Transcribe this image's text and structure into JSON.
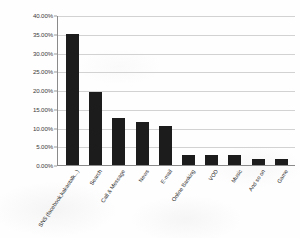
{
  "chart_data": {
    "type": "bar",
    "title": "",
    "xlabel": "",
    "ylabel": "",
    "categories": [
      "SNS (facebook,kakaotalk...)",
      "Search",
      "Call & Message",
      "News",
      "E-mail",
      "Online Banking",
      "VOD",
      "Music",
      "And so on",
      "Game"
    ],
    "values": [
      35.0,
      19.5,
      12.5,
      11.5,
      10.5,
      2.8,
      2.8,
      2.8,
      1.6,
      1.6
    ],
    "value_labels": [
      "35.00%",
      "19.50%",
      "12.50%",
      "11.50%",
      "10.50%",
      "2.80%",
      "2.80%",
      "2.80%",
      "1.60%",
      "1.60%"
    ],
    "ylim": [
      0,
      40
    ],
    "ytick_values": [
      0,
      5,
      10,
      15,
      20,
      25,
      30,
      35,
      40
    ],
    "ytick_labels": [
      "0.00%",
      "5.00%",
      "10.00%",
      "15.00%",
      "20.00%",
      "25.00%",
      "30.00%",
      "35.00%",
      "40.00%"
    ],
    "grid": true,
    "legend": false,
    "series_color": "#1c1c1c",
    "gridline_color": "#d2d2d2",
    "axis_color": "#8a8a8a"
  }
}
